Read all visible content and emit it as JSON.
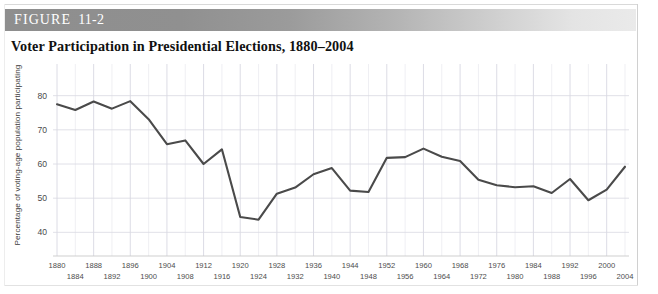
{
  "figure": {
    "header_word": "FIGURE",
    "header_number": "11-2",
    "title": "Voter Participation in Presidential Elections, 1880–2004"
  },
  "colors": {
    "header_bar_start": "#8e8e8e",
    "header_bar_end": "#eaeaea",
    "header_text": "#ffffff",
    "line": "#4a4a4a",
    "grid_minor": "#e8e8ee",
    "grid_major": "#d8d8e2",
    "tick_text": "#4d4d4d",
    "background": "#ffffff"
  },
  "chart_data": {
    "type": "line",
    "title": "Voter Participation in Presidential Elections, 1880–2004",
    "xlabel": "",
    "ylabel": "Percentage of voting-age population participating",
    "ylim": [
      36,
      84
    ],
    "xlim": [
      1880,
      2004
    ],
    "yticks": [
      40,
      50,
      60,
      70,
      80
    ],
    "grid": true,
    "legend": null,
    "x": [
      1880,
      1884,
      1888,
      1892,
      1896,
      1900,
      1904,
      1908,
      1912,
      1916,
      1920,
      1924,
      1928,
      1932,
      1936,
      1940,
      1944,
      1948,
      1952,
      1956,
      1960,
      1964,
      1968,
      1972,
      1976,
      1980,
      1984,
      1988,
      1992,
      1996,
      2000,
      2004
    ],
    "values": [
      77.5,
      75.8,
      78.3,
      76.2,
      78.4,
      73.1,
      65.8,
      66.9,
      60.0,
      64.3,
      44.5,
      43.7,
      51.3,
      53.1,
      57.0,
      58.8,
      52.2,
      51.8,
      61.8,
      62.0,
      64.5,
      62.1,
      60.9,
      55.4,
      53.8,
      53.2,
      53.5,
      51.5,
      55.6,
      49.4,
      52.5,
      59.2
    ],
    "xtick_labels_row1": [
      1880,
      1888,
      1896,
      1904,
      1912,
      1920,
      1928,
      1936,
      1944,
      1952,
      1960,
      1968,
      1976,
      1984,
      1992,
      2000
    ],
    "xtick_labels_row2": [
      1884,
      1892,
      1900,
      1908,
      1916,
      1924,
      1932,
      1940,
      1948,
      1956,
      1964,
      1972,
      1980,
      1988,
      1996,
      2004
    ]
  }
}
